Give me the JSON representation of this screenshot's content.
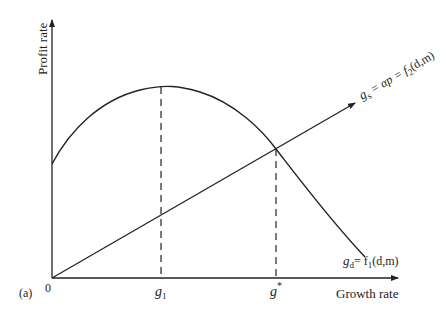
{
  "figure": {
    "panel_label": "(a)",
    "y_axis_label": "Profit rate",
    "x_axis_label": "Growth rate",
    "origin_label": "0",
    "x_ticks": [
      {
        "base": "g",
        "sub": "1",
        "sup": ""
      },
      {
        "base": "g",
        "sub": "",
        "sup": "*"
      }
    ],
    "curves": {
      "demand": {
        "label_lhs_base": "g",
        "label_lhs_sub": "d",
        "label_rhs": "= f",
        "label_rhs_sub": "1",
        "label_rhs_args": "(d,m)"
      },
      "savings": {
        "label_lhs_base": "g",
        "label_lhs_sub": "s",
        "label_mid": " = αp = f",
        "label_rhs_sub": "2",
        "label_rhs_args": "(d,m)"
      }
    },
    "colors": {
      "ink": "#222222",
      "background": "#ffffff"
    }
  }
}
